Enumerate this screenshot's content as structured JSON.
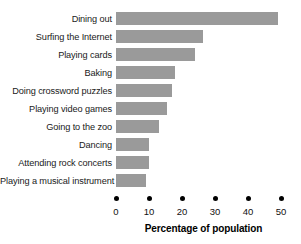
{
  "chart_data": {
    "type": "bar",
    "orientation": "horizontal",
    "title": "",
    "subtitle": "",
    "xlabel": "Percentage of population",
    "ylabel": "",
    "xlim": [
      0,
      50
    ],
    "xticks": [
      0,
      10,
      20,
      30,
      40,
      50
    ],
    "xtick_labels": [
      "0",
      "10",
      "20",
      "30",
      "40",
      "50"
    ],
    "grid": false,
    "legend": false,
    "legend_position": "none",
    "categories": [
      "Dining out",
      "Surfing the Internet",
      "Playing cards",
      "Baking",
      "Doing crossword puzzles",
      "Playing video games",
      "Going to the zoo",
      "Dancing",
      "Attending rock concerts",
      "Playing a musical instrument"
    ],
    "values": [
      49,
      26.5,
      24,
      18,
      17,
      15.5,
      13,
      10,
      10,
      9
    ],
    "bar_color": "#9a9a9a",
    "text_color": "#1a1a1a",
    "axis_color": "#000000"
  }
}
